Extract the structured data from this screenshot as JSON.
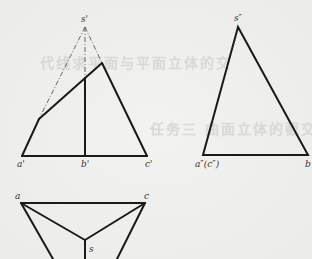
{
  "figure": {
    "type": "orthographic projection of truncated triangular pyramid",
    "front_view": {
      "labels": {
        "apex": "s'",
        "left": "a'",
        "middle": "b'",
        "right": "c'"
      },
      "points": {
        "apex": [
          85,
          27
        ],
        "a": [
          22,
          156
        ],
        "b": [
          85,
          156
        ],
        "c": [
          147,
          156
        ],
        "cut_left": [
          39,
          119
        ],
        "cut_right": [
          102,
          63
        ],
        "cut_mid": [
          85,
          78
        ]
      }
    },
    "side_view": {
      "labels": {
        "apex": "s″",
        "left": "a″(c″)",
        "right": "b"
      },
      "points": {
        "apex": [
          238,
          27
        ],
        "left": [
          203,
          155
        ],
        "right": [
          308,
          155
        ]
      }
    },
    "top_view": {
      "labels": {
        "left": "a",
        "right": "c",
        "center": "s"
      },
      "points": {
        "a": [
          21,
          203
        ],
        "c": [
          145,
          203
        ],
        "s": [
          85,
          240
        ],
        "a_down": [
          53,
          259
        ],
        "c_down": [
          117,
          259
        ],
        "s_down": [
          85,
          259
        ]
      }
    },
    "colors": {
      "line": "#1a1a1a",
      "background": "#efefed"
    }
  },
  "background_bleed_text": {
    "line1": "代线求平面与平面立体的交",
    "line2": "任务三 曲面立体的截交线"
  }
}
